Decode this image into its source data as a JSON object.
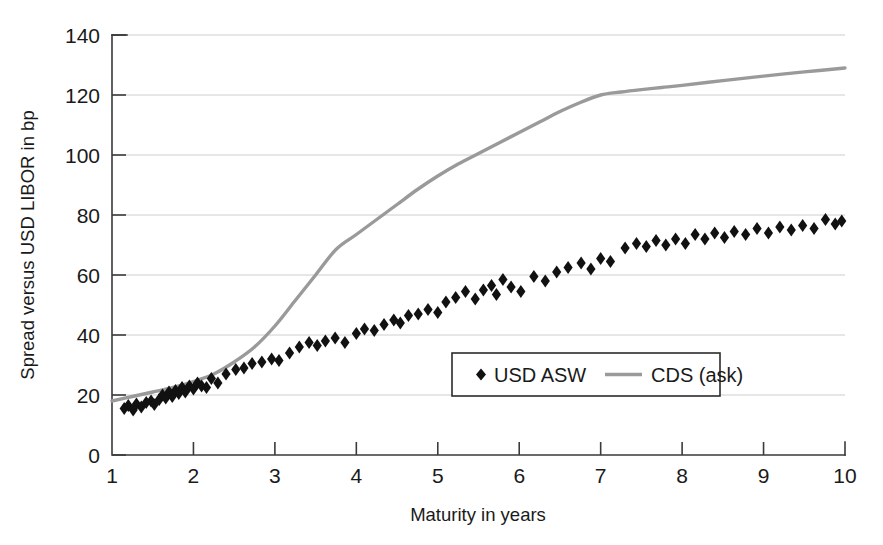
{
  "chart_data": {
    "type": "scatter",
    "title": "",
    "xlabel": "Maturity in years",
    "ylabel": "Spread versus USD LIBOR in bp",
    "xlim": [
      1,
      10
    ],
    "ylim": [
      0,
      140
    ],
    "xticks": [
      1,
      2,
      3,
      4,
      5,
      6,
      7,
      8,
      9,
      10
    ],
    "yticks": [
      0,
      20,
      40,
      60,
      80,
      100,
      120,
      140
    ],
    "grid": "horizontal",
    "legend_position": "inside-lower-center",
    "series": [
      {
        "name": "USD ASW",
        "type": "scatter",
        "marker": "diamond",
        "color": "#111111",
        "points": [
          [
            1.15,
            15.5
          ],
          [
            1.2,
            16.5
          ],
          [
            1.26,
            15.0
          ],
          [
            1.3,
            17.0
          ],
          [
            1.36,
            16.0
          ],
          [
            1.42,
            17.5
          ],
          [
            1.48,
            18.0
          ],
          [
            1.52,
            16.8
          ],
          [
            1.58,
            18.5
          ],
          [
            1.62,
            20.0
          ],
          [
            1.66,
            19.0
          ],
          [
            1.7,
            21.0
          ],
          [
            1.74,
            19.5
          ],
          [
            1.78,
            21.5
          ],
          [
            1.82,
            20.5
          ],
          [
            1.86,
            22.5
          ],
          [
            1.9,
            21.0
          ],
          [
            1.95,
            23.0
          ],
          [
            2.0,
            22.0
          ],
          [
            2.05,
            24.0
          ],
          [
            2.1,
            23.0
          ],
          [
            2.16,
            22.5
          ],
          [
            2.22,
            25.5
          ],
          [
            2.3,
            24.0
          ],
          [
            2.4,
            27.0
          ],
          [
            2.52,
            28.5
          ],
          [
            2.62,
            29.0
          ],
          [
            2.72,
            30.5
          ],
          [
            2.84,
            31.0
          ],
          [
            2.96,
            32.0
          ],
          [
            3.05,
            31.5
          ],
          [
            3.18,
            34.0
          ],
          [
            3.3,
            36.0
          ],
          [
            3.42,
            37.5
          ],
          [
            3.52,
            36.5
          ],
          [
            3.62,
            38.0
          ],
          [
            3.74,
            39.0
          ],
          [
            3.86,
            37.5
          ],
          [
            4.0,
            40.5
          ],
          [
            4.1,
            42.0
          ],
          [
            4.22,
            41.5
          ],
          [
            4.34,
            43.5
          ],
          [
            4.46,
            45.0
          ],
          [
            4.54,
            44.0
          ],
          [
            4.64,
            46.5
          ],
          [
            4.76,
            47.0
          ],
          [
            4.88,
            48.5
          ],
          [
            5.0,
            47.5
          ],
          [
            5.1,
            51.0
          ],
          [
            5.22,
            52.5
          ],
          [
            5.34,
            54.5
          ],
          [
            5.46,
            52.0
          ],
          [
            5.56,
            55.0
          ],
          [
            5.66,
            56.5
          ],
          [
            5.72,
            53.5
          ],
          [
            5.8,
            58.5
          ],
          [
            5.9,
            56.0
          ],
          [
            6.02,
            54.5
          ],
          [
            6.18,
            59.5
          ],
          [
            6.32,
            58.0
          ],
          [
            6.46,
            61.0
          ],
          [
            6.6,
            62.5
          ],
          [
            6.76,
            64.0
          ],
          [
            6.88,
            62.0
          ],
          [
            7.0,
            65.5
          ],
          [
            7.12,
            64.5
          ],
          [
            7.3,
            69.0
          ],
          [
            7.44,
            70.5
          ],
          [
            7.56,
            69.5
          ],
          [
            7.68,
            71.5
          ],
          [
            7.8,
            70.0
          ],
          [
            7.92,
            72.0
          ],
          [
            8.04,
            70.5
          ],
          [
            8.16,
            73.5
          ],
          [
            8.28,
            72.0
          ],
          [
            8.4,
            74.0
          ],
          [
            8.52,
            72.5
          ],
          [
            8.64,
            74.5
          ],
          [
            8.78,
            73.5
          ],
          [
            8.92,
            75.5
          ],
          [
            9.06,
            74.0
          ],
          [
            9.2,
            76.0
          ],
          [
            9.34,
            75.0
          ],
          [
            9.48,
            76.5
          ],
          [
            9.62,
            75.5
          ],
          [
            9.76,
            78.5
          ],
          [
            9.88,
            77.0
          ],
          [
            9.96,
            78.0
          ]
        ]
      },
      {
        "name": "CDS (ask)",
        "type": "line",
        "color": "#9a9a9a",
        "points": [
          [
            1.0,
            18.0
          ],
          [
            1.25,
            19.5
          ],
          [
            1.5,
            21.0
          ],
          [
            1.75,
            22.5
          ],
          [
            2.0,
            24.5
          ],
          [
            2.25,
            27.0
          ],
          [
            2.5,
            31.0
          ],
          [
            2.75,
            36.0
          ],
          [
            3.0,
            43.0
          ],
          [
            3.25,
            51.5
          ],
          [
            3.5,
            60.0
          ],
          [
            3.75,
            68.5
          ],
          [
            4.0,
            73.5
          ],
          [
            4.25,
            78.5
          ],
          [
            4.5,
            83.5
          ],
          [
            4.75,
            88.5
          ],
          [
            5.0,
            93.0
          ],
          [
            5.25,
            97.0
          ],
          [
            5.5,
            100.5
          ],
          [
            5.75,
            104.0
          ],
          [
            6.0,
            107.5
          ],
          [
            6.25,
            111.0
          ],
          [
            6.5,
            114.5
          ],
          [
            6.75,
            117.5
          ],
          [
            7.0,
            120.0
          ],
          [
            7.25,
            121.0
          ],
          [
            7.5,
            121.8
          ],
          [
            7.75,
            122.5
          ],
          [
            8.0,
            123.2
          ],
          [
            8.5,
            124.8
          ],
          [
            9.0,
            126.3
          ],
          [
            9.5,
            127.7
          ],
          [
            10.0,
            129.0
          ]
        ]
      }
    ]
  },
  "axes": {
    "x_tick_labels": [
      "1",
      "2",
      "3",
      "4",
      "5",
      "6",
      "7",
      "8",
      "9",
      "10"
    ],
    "y_tick_labels": [
      "0",
      "20",
      "40",
      "60",
      "80",
      "100",
      "120",
      "140"
    ],
    "x_axis_title": "Maturity in years",
    "y_axis_title": "Spread versus USD LIBOR in bp"
  },
  "legend": {
    "entries": [
      {
        "label": "USD ASW",
        "marker": "diamond",
        "color": "#111111"
      },
      {
        "label": "CDS (ask)",
        "marker": "line",
        "color": "#9a9a9a"
      }
    ]
  },
  "colors": {
    "cds_line": "#9a9a9a",
    "asw_marker": "#111111",
    "gridline": "#c8c8c8",
    "axis": "#3a3a3a",
    "background": "#ffffff"
  }
}
